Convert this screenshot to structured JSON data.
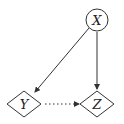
{
  "diagram": {
    "nodes": [
      {
        "id": "X",
        "label": "X",
        "shape": "circle"
      },
      {
        "id": "Y",
        "label": "Y",
        "shape": "diamond"
      },
      {
        "id": "Z",
        "label": "Z",
        "shape": "diamond"
      }
    ],
    "edges": [
      {
        "from": "X",
        "to": "Y",
        "style": "solid"
      },
      {
        "from": "X",
        "to": "Z",
        "style": "solid"
      },
      {
        "from": "Y",
        "to": "Z",
        "style": "dotted"
      }
    ],
    "colors": {
      "stroke": "#333333",
      "background": "#ffffff"
    }
  }
}
